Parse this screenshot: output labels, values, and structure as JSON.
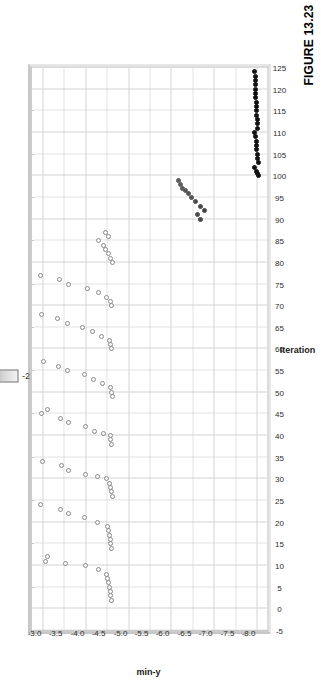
{
  "figure": {
    "caption": "FIGURE 13.23"
  },
  "legend": {
    "title_part1": "min",
    "title_part2": "-y",
    "min_label": "-7.969",
    "max_label": "-2.767",
    "colors": {
      "dark": "#141414",
      "light": "#f2f2f2",
      "title_color_1": "#b02318",
      "title_color_2": "#16949b"
    }
  },
  "chart_data": {
    "type": "scatter",
    "title": "",
    "xlabel": "Iteration",
    "ylabel": "min-y",
    "xlim": [
      -5,
      125
    ],
    "ylim": [
      -8.25,
      -2.75
    ],
    "grid": true,
    "legend_position": "top-left",
    "xticks": [
      -5,
      0,
      5,
      10,
      15,
      20,
      25,
      30,
      35,
      40,
      45,
      50,
      55,
      60,
      65,
      70,
      75,
      80,
      85,
      90,
      95,
      100,
      105,
      110,
      115,
      120,
      125
    ],
    "xticklabels": [
      "-5",
      "0",
      "5",
      "10",
      "15",
      "20",
      "25",
      "30",
      "35",
      "40",
      "45",
      "50",
      "55",
      "60",
      "65",
      "70",
      "75",
      "80",
      "85",
      "90",
      "95",
      "100",
      "105",
      "110",
      "115",
      "120",
      "125"
    ],
    "yticks": [
      -3.0,
      -3.5,
      -4.0,
      -4.5,
      -5.0,
      -5.5,
      -6.0,
      -6.5,
      -7.0,
      -7.5,
      -8.0
    ],
    "yticklabels": [
      "-3.0",
      "-3.5",
      "-4.0",
      "-4.5",
      "-5.0",
      "-5.5",
      "-6.0",
      "-6.5",
      "-7.0",
      "-7.5",
      "-8.0"
    ],
    "colormap": "grayscale",
    "colormap_range": [
      -7.969,
      -2.767
    ],
    "marker": "circle-open",
    "series": [
      {
        "name": "min-y per iteration",
        "points": [
          [
            2,
            -4.62
          ],
          [
            3,
            -4.6
          ],
          [
            4,
            -4.58
          ],
          [
            5,
            -4.57
          ],
          [
            6,
            -4.55
          ],
          [
            7,
            -4.53
          ],
          [
            8,
            -4.5
          ],
          [
            9,
            -4.3
          ],
          [
            10,
            -4.0
          ],
          [
            10.5,
            -3.55
          ],
          [
            11,
            -3.07
          ],
          [
            12,
            -3.12
          ],
          [
            14,
            -4.62
          ],
          [
            15,
            -4.6
          ],
          [
            16,
            -4.58
          ],
          [
            17,
            -4.56
          ],
          [
            18,
            -4.54
          ],
          [
            19,
            -4.52
          ],
          [
            20,
            -4.28
          ],
          [
            21,
            -3.98
          ],
          [
            22,
            -3.62
          ],
          [
            23,
            -3.42
          ],
          [
            24,
            -2.97
          ],
          [
            26,
            -4.63
          ],
          [
            27,
            -4.61
          ],
          [
            28,
            -4.59
          ],
          [
            29,
            -4.57
          ],
          [
            30,
            -4.5
          ],
          [
            30.5,
            -4.28
          ],
          [
            31,
            -4.0
          ],
          [
            32,
            -3.62
          ],
          [
            33,
            -3.45
          ],
          [
            34,
            -3.0
          ],
          [
            38,
            -4.62
          ],
          [
            39,
            -4.6
          ],
          [
            40,
            -4.58
          ],
          [
            40.5,
            -4.42
          ],
          [
            41,
            -4.22
          ],
          [
            42,
            -4.0
          ],
          [
            43,
            -3.62
          ],
          [
            44,
            -3.42
          ],
          [
            45,
            -2.98
          ],
          [
            46,
            -3.12
          ],
          [
            49,
            -4.63
          ],
          [
            50,
            -4.61
          ],
          [
            51,
            -4.58
          ],
          [
            52,
            -4.4
          ],
          [
            53,
            -4.2
          ],
          [
            54,
            -3.98
          ],
          [
            55,
            -3.6
          ],
          [
            56,
            -3.38
          ],
          [
            57,
            -3.02
          ],
          [
            60,
            -4.62
          ],
          [
            61,
            -4.6
          ],
          [
            62,
            -4.56
          ],
          [
            63,
            -4.38
          ],
          [
            64,
            -4.18
          ],
          [
            65,
            -3.95
          ],
          [
            66,
            -3.58
          ],
          [
            67,
            -3.35
          ],
          [
            68,
            -2.98
          ],
          [
            70,
            -4.62
          ],
          [
            71,
            -4.59
          ],
          [
            72,
            -4.5
          ],
          [
            73,
            -4.3
          ],
          [
            74,
            -4.05
          ],
          [
            75,
            -3.62
          ],
          [
            76,
            -3.4
          ],
          [
            77,
            -2.95
          ],
          [
            80,
            -4.63
          ],
          [
            81,
            -4.6
          ],
          [
            82,
            -4.55
          ],
          [
            83,
            -4.48
          ],
          [
            84,
            -4.42
          ],
          [
            85,
            -4.3
          ],
          [
            86,
            -4.55
          ],
          [
            87,
            -4.48
          ],
          [
            90,
            -6.7
          ],
          [
            91,
            -6.62
          ],
          [
            92,
            -6.78
          ],
          [
            93,
            -6.68
          ],
          [
            94,
            -6.58
          ],
          [
            95,
            -6.48
          ],
          [
            96,
            -6.42
          ],
          [
            96.5,
            -6.35
          ],
          [
            97,
            -6.28
          ],
          [
            98,
            -6.22
          ],
          [
            99,
            -6.18
          ],
          [
            100,
            -8.05
          ],
          [
            100.5,
            -8.02
          ],
          [
            101,
            -8.0
          ],
          [
            102,
            -7.95
          ],
          [
            103,
            -8.03
          ],
          [
            104,
            -8.02
          ],
          [
            105,
            -8.01
          ],
          [
            106,
            -8.0
          ],
          [
            107,
            -8.0
          ],
          [
            108,
            -7.99
          ],
          [
            109,
            -7.98
          ],
          [
            110,
            -7.95
          ],
          [
            111,
            -8.02
          ],
          [
            112,
            -8.01
          ],
          [
            113,
            -8.01
          ],
          [
            114,
            -8.0
          ],
          [
            115,
            -8.0
          ],
          [
            116,
            -7.99
          ],
          [
            117,
            -7.99
          ],
          [
            118,
            -7.98
          ],
          [
            119,
            -7.98
          ],
          [
            120,
            -7.97
          ],
          [
            121,
            -7.97
          ],
          [
            122,
            -7.96
          ],
          [
            123,
            -7.96
          ],
          [
            124,
            -7.95
          ]
        ]
      }
    ]
  }
}
